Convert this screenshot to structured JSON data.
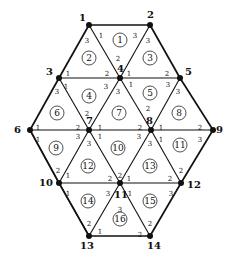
{
  "diagram": {
    "type": "triangular finite element mesh (hexagonal domain)",
    "nodes": [
      {
        "id": "1",
        "x": 89,
        "y": 25,
        "lx": -10,
        "ly": -4
      },
      {
        "id": "2",
        "x": 150,
        "y": 25,
        "lx": -3,
        "ly": -7
      },
      {
        "id": "3",
        "x": 59,
        "y": 78,
        "lx": -13,
        "ly": -3
      },
      {
        "id": "4",
        "x": 120,
        "y": 78,
        "lx": -3,
        "ly": -6
      },
      {
        "id": "5",
        "x": 180,
        "y": 78,
        "lx": 5,
        "ly": -3
      },
      {
        "id": "6",
        "x": 30,
        "y": 130,
        "lx": -16,
        "ly": 3
      },
      {
        "id": "7",
        "x": 89,
        "y": 130,
        "lx": -3,
        "ly": -6
      },
      {
        "id": "8",
        "x": 151,
        "y": 130,
        "lx": -5,
        "ly": -6
      },
      {
        "id": "9",
        "x": 213,
        "y": 130,
        "lx": 3,
        "ly": 3
      },
      {
        "id": "10",
        "x": 59,
        "y": 183,
        "lx": -20,
        "ly": 3
      },
      {
        "id": "11",
        "x": 120,
        "y": 183,
        "lx": -6,
        "ly": 15
      },
      {
        "id": "12",
        "x": 181,
        "y": 183,
        "lx": 6,
        "ly": 5
      },
      {
        "id": "13",
        "x": 89,
        "y": 236,
        "lx": -9,
        "ly": 13
      },
      {
        "id": "14",
        "x": 150,
        "y": 236,
        "lx": -3,
        "ly": 13
      }
    ],
    "boundary_edges": [
      [
        "1",
        "2"
      ],
      [
        "2",
        "5"
      ],
      [
        "5",
        "9"
      ],
      [
        "9",
        "12"
      ],
      [
        "12",
        "14"
      ],
      [
        "14",
        "13"
      ],
      [
        "13",
        "10"
      ],
      [
        "10",
        "6"
      ],
      [
        "6",
        "3"
      ],
      [
        "3",
        "1"
      ]
    ],
    "interior_edges": [
      [
        "1",
        "4"
      ],
      [
        "2",
        "4"
      ],
      [
        "3",
        "4"
      ],
      [
        "4",
        "5"
      ],
      [
        "3",
        "7"
      ],
      [
        "4",
        "7"
      ],
      [
        "4",
        "8"
      ],
      [
        "5",
        "8"
      ],
      [
        "6",
        "7"
      ],
      [
        "7",
        "8"
      ],
      [
        "8",
        "9"
      ],
      [
        "6",
        "10"
      ],
      [
        "7",
        "10"
      ],
      [
        "7",
        "11"
      ],
      [
        "8",
        "11"
      ],
      [
        "8",
        "12"
      ],
      [
        "10",
        "11"
      ],
      [
        "11",
        "12"
      ],
      [
        "10",
        "13"
      ],
      [
        "11",
        "13"
      ],
      [
        "11",
        "14"
      ]
    ],
    "elements": [
      {
        "id": "1",
        "x": 120,
        "y": 40
      },
      {
        "id": "2",
        "x": 89,
        "y": 58
      },
      {
        "id": "3",
        "x": 150,
        "y": 58
      },
      {
        "id": "4",
        "x": 89,
        "y": 96
      },
      {
        "id": "5",
        "x": 150,
        "y": 93
      },
      {
        "id": "6",
        "x": 57,
        "y": 113
      },
      {
        "id": "7",
        "x": 119,
        "y": 113
      },
      {
        "id": "8",
        "x": 179,
        "y": 113
      },
      {
        "id": "9",
        "x": 56,
        "y": 148
      },
      {
        "id": "10",
        "x": 118,
        "y": 148
      },
      {
        "id": "11",
        "x": 180,
        "y": 145
      },
      {
        "id": "12",
        "x": 88,
        "y": 166
      },
      {
        "id": "13",
        "x": 150,
        "y": 166
      },
      {
        "id": "14",
        "x": 88,
        "y": 201
      },
      {
        "id": "15",
        "x": 150,
        "y": 201
      },
      {
        "id": "16",
        "x": 120,
        "y": 219
      }
    ],
    "local_labels": [
      {
        "t": "1",
        "x": 101,
        "y": 35
      },
      {
        "t": "3",
        "x": 135,
        "y": 35
      },
      {
        "t": "3",
        "x": 87,
        "y": 40
      },
      {
        "t": "3",
        "x": 148,
        "y": 40
      },
      {
        "t": "2",
        "x": 118,
        "y": 58
      },
      {
        "t": "1",
        "x": 68,
        "y": 73
      },
      {
        "t": "2",
        "x": 107,
        "y": 73
      },
      {
        "t": "1",
        "x": 129,
        "y": 73
      },
      {
        "t": "2",
        "x": 167,
        "y": 73
      },
      {
        "t": "1",
        "x": 66,
        "y": 86
      },
      {
        "t": "3",
        "x": 57,
        "y": 91
      },
      {
        "t": "3",
        "x": 106,
        "y": 86
      },
      {
        "t": "3",
        "x": 118,
        "y": 91
      },
      {
        "t": "1",
        "x": 131,
        "y": 84
      },
      {
        "t": "3",
        "x": 168,
        "y": 84
      },
      {
        "t": "3",
        "x": 178,
        "y": 91
      },
      {
        "t": "2",
        "x": 148,
        "y": 108
      },
      {
        "t": "2",
        "x": 87,
        "y": 113
      },
      {
        "t": "1",
        "x": 38,
        "y": 127
      },
      {
        "t": "2",
        "x": 78,
        "y": 127
      },
      {
        "t": "1",
        "x": 100,
        "y": 127
      },
      {
        "t": "2",
        "x": 140,
        "y": 127
      },
      {
        "t": "1",
        "x": 161,
        "y": 127
      },
      {
        "t": "2",
        "x": 200,
        "y": 127
      },
      {
        "t": "1",
        "x": 38,
        "y": 139
      },
      {
        "t": "3",
        "x": 78,
        "y": 136
      },
      {
        "t": "3",
        "x": 89,
        "y": 143
      },
      {
        "t": "1",
        "x": 100,
        "y": 136
      },
      {
        "t": "3",
        "x": 139,
        "y": 136
      },
      {
        "t": "3",
        "x": 150,
        "y": 143
      },
      {
        "t": "1",
        "x": 161,
        "y": 139
      },
      {
        "t": "3",
        "x": 200,
        "y": 139
      },
      {
        "t": "2",
        "x": 58,
        "y": 170
      },
      {
        "t": "1",
        "x": 68,
        "y": 175
      },
      {
        "t": "2",
        "x": 110,
        "y": 178
      },
      {
        "t": "2",
        "x": 120,
        "y": 175
      },
      {
        "t": "1",
        "x": 129,
        "y": 178
      },
      {
        "t": "2",
        "x": 170,
        "y": 178
      },
      {
        "t": "2",
        "x": 181,
        "y": 170
      },
      {
        "t": "1",
        "x": 68,
        "y": 193
      },
      {
        "t": "3",
        "x": 108,
        "y": 193
      },
      {
        "t": "1",
        "x": 130,
        "y": 193
      },
      {
        "t": "3",
        "x": 171,
        "y": 193
      },
      {
        "t": "3",
        "x": 120,
        "y": 209
      },
      {
        "t": "2",
        "x": 89,
        "y": 223
      },
      {
        "t": "1",
        "x": 100,
        "y": 231
      },
      {
        "t": "2",
        "x": 150,
        "y": 223
      },
      {
        "t": "2",
        "x": 140,
        "y": 234
      }
    ]
  }
}
